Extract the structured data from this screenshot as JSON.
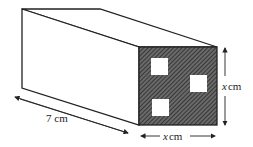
{
  "diagram": {
    "labels": {
      "length": "7 cm",
      "width_var": "x",
      "width_unit": "cm",
      "height_var": "x",
      "height_unit": "cm"
    },
    "colors": {
      "stroke": "#222222",
      "hatch_bg": "#555555",
      "background": "#ffffff"
    }
  }
}
